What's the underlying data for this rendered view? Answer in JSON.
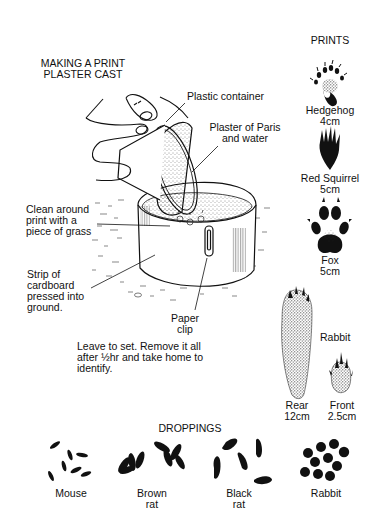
{
  "cast": {
    "title_line1": "MAKING A PRINT",
    "title_line2": "PLASTER CAST",
    "labels": {
      "plastic_container": "Plastic container",
      "plaster_line1": "Plaster of Paris",
      "plaster_line2": "and water",
      "clean_line1": "Clean around",
      "clean_line2": "print with a",
      "clean_line3": "piece of grass",
      "strip_line1": "Strip of",
      "strip_line2": "cardboard",
      "strip_line3": "pressed into",
      "strip_line4": "ground.",
      "clip_line1": "Paper",
      "clip_line2": "clip"
    },
    "instructions_line1": "Leave to set. Remove it all",
    "instructions_line2": "after ½hr and take home to",
    "instructions_line3": "identify."
  },
  "prints": {
    "heading": "PRINTS",
    "items": [
      {
        "name": "Hedgehog",
        "size": "4cm"
      },
      {
        "name": "Red Squirrel",
        "size": "5cm"
      },
      {
        "name": "Fox",
        "size": "5cm"
      }
    ],
    "rabbit": {
      "name": "Rabbit",
      "rear_label": "Rear",
      "rear_size": "12cm",
      "front_label": "Front",
      "front_size": "2.5cm"
    }
  },
  "droppings": {
    "heading": "DROPPINGS",
    "items": [
      {
        "line1": "Mouse",
        "line2": ""
      },
      {
        "line1": "Brown",
        "line2": "rat"
      },
      {
        "line1": "Black",
        "line2": "rat"
      },
      {
        "line1": "Rabbit",
        "line2": ""
      }
    ]
  }
}
